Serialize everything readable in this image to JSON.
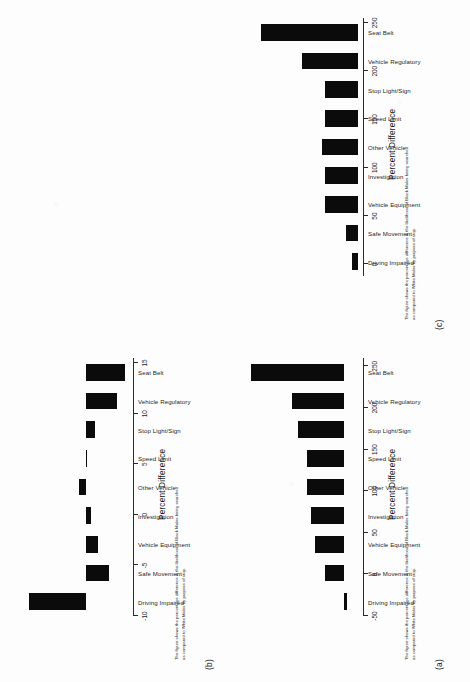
{
  "document": {
    "kind": "scanned-figure-page",
    "orientation": "rotated-90-ccw"
  },
  "axis_title": "Percent Difference",
  "caption_line1": "The figure shows the percentage difference in the likelihood of Black Males being searched",
  "caption_line2": "as compared to White Males by purpose of stop.",
  "caption_line1_c": "The figure shows the percentage difference in the likelihood of Black Males being searched",
  "caption_line2_c": "as compared to White Males by purpose of stop.",
  "categories": [
    "Driving Impaired",
    "Safe Movement",
    "Vehicle Equipment",
    "Investigation",
    "Other Vehicle",
    "Speed Limit",
    "Stop Light/Sign",
    "Vehicle Regulatory",
    "Seat Belt"
  ],
  "panels": [
    {
      "tag": "(a)"
    },
    {
      "tag": "(b)"
    },
    {
      "tag": "(c)"
    }
  ],
  "chart_data": [
    {
      "type": "bar",
      "panel": "(a)",
      "title": "",
      "xlabel": "",
      "ylabel": "Percent Difference",
      "orientation": "vertical",
      "grid": false,
      "legend": "none",
      "ylim": [
        -50,
        260
      ],
      "yticks": [
        -50,
        0,
        50,
        100,
        150,
        200,
        250
      ],
      "ticklabels": [
        "-50",
        "0",
        "50",
        "100",
        "150",
        "200",
        "250"
      ],
      "categories": [
        "Driving Impaired",
        "Safe Movement",
        "Vehicle Equipment",
        "Investigation",
        "Other Vehicle",
        "Speed Limit",
        "Stop Light/Sign",
        "Vehicle Regulatory",
        "Seat Belt"
      ],
      "values": [
        -9,
        48,
        75,
        85,
        95,
        96,
        118,
        133,
        240
      ],
      "annotation": "The figure shows the percentage difference in the likelihood of Black Males being searched as compared to White Males by purpose of stop."
    },
    {
      "type": "bar",
      "panel": "(b)",
      "title": "",
      "xlabel": "",
      "ylabel": "Percent Difference",
      "orientation": "vertical",
      "grid": false,
      "legend": "none",
      "ylim": [
        -10,
        15.5
      ],
      "yticks": [
        -10,
        -5,
        0,
        5,
        10,
        15
      ],
      "ticklabels": [
        "-10",
        "-5",
        "0",
        "5",
        "10",
        "15"
      ],
      "categories": [
        "Driving Impaired",
        "Safe Movement",
        "Vehicle Equipment",
        "Investigation",
        "Other Vehicle",
        "Speed Limit",
        "Stop Light/Sign",
        "Vehicle Regulatory",
        "Seat Belt"
      ],
      "values": [
        12.2,
        -4.9,
        -2.5,
        -1.1,
        1.5,
        -0.3,
        -2.0,
        -6.5,
        -8.4
      ],
      "annotation": "The figure shows the percentage difference in the likelihood of Black Males being searched as compared to White Males by purpose of stop."
    },
    {
      "type": "bar",
      "panel": "(c)",
      "title": "",
      "xlabel": "",
      "ylabel": "Percent Difference",
      "orientation": "vertical",
      "grid": false,
      "legend": "none",
      "ylim": [
        -12,
        255
      ],
      "yticks": [
        0,
        50,
        100,
        150,
        200,
        250
      ],
      "ticklabels": [
        "0",
        "50",
        "100",
        "150",
        "200",
        "250"
      ],
      "categories": [
        "Driving Impaired",
        "Safe Movement",
        "Vehicle Equipment",
        "Investigation",
        "Other Vehicle",
        "Speed Limit",
        "Stop Light/Sign",
        "Vehicle Regulatory",
        "Seat Belt"
      ],
      "values": [
        12,
        26,
        72,
        72,
        80,
        73,
        73,
        123,
        215
      ],
      "annotation": "The figure shows the percentage difference in the likelihood of Black Males being searched as compared to White Males by purpose of stop."
    }
  ]
}
